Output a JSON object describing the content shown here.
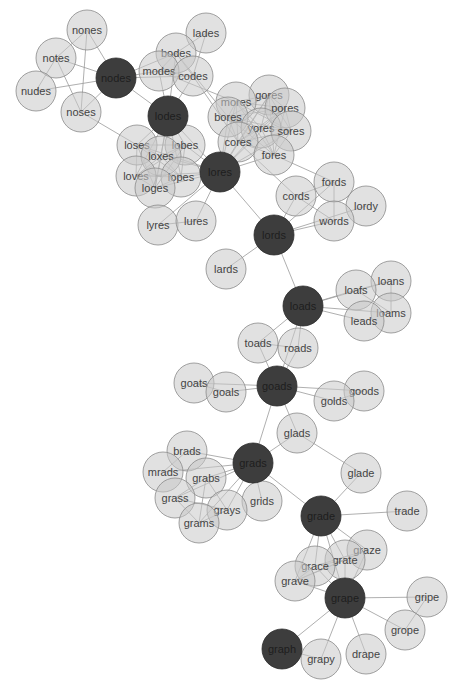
{
  "diagram": {
    "type": "word-ladder-network",
    "node_radius": 20,
    "colors": {
      "path_node": "#3d3d3d",
      "neighbor_node": "#d6d6d6",
      "edge": "#9a9a9a",
      "text": "#444444"
    },
    "nodes": [
      {
        "id": "nones",
        "x": 87,
        "y": 30,
        "dark": false
      },
      {
        "id": "lades",
        "x": 206,
        "y": 33,
        "dark": false
      },
      {
        "id": "notes",
        "x": 56,
        "y": 58,
        "dark": false
      },
      {
        "id": "bodes",
        "x": 176,
        "y": 53,
        "dark": false
      },
      {
        "id": "nodes",
        "x": 116,
        "y": 78,
        "dark": true
      },
      {
        "id": "modes",
        "x": 159,
        "y": 71,
        "dark": false
      },
      {
        "id": "codes",
        "x": 193,
        "y": 76,
        "dark": false
      },
      {
        "id": "nudes",
        "x": 36,
        "y": 91,
        "dark": false
      },
      {
        "id": "noses",
        "x": 81,
        "y": 112,
        "dark": false
      },
      {
        "id": "lodes",
        "x": 168,
        "y": 116,
        "dark": true
      },
      {
        "id": "gores",
        "x": 269,
        "y": 95,
        "dark": false
      },
      {
        "id": "mores",
        "x": 236,
        "y": 102,
        "dark": false
      },
      {
        "id": "pores",
        "x": 285,
        "y": 108,
        "dark": false
      },
      {
        "id": "bores",
        "x": 228,
        "y": 117,
        "dark": false
      },
      {
        "id": "yores",
        "x": 261,
        "y": 128,
        "dark": false
      },
      {
        "id": "sores",
        "x": 291,
        "y": 131,
        "dark": false
      },
      {
        "id": "cores",
        "x": 238,
        "y": 142,
        "dark": false
      },
      {
        "id": "fores",
        "x": 274,
        "y": 155,
        "dark": false
      },
      {
        "id": "loses",
        "x": 137,
        "y": 145,
        "dark": false
      },
      {
        "id": "lobes",
        "x": 185,
        "y": 145,
        "dark": false
      },
      {
        "id": "loxes",
        "x": 161,
        "y": 156,
        "dark": false
      },
      {
        "id": "loves",
        "x": 136,
        "y": 176,
        "dark": false
      },
      {
        "id": "lopes",
        "x": 181,
        "y": 177,
        "dark": false
      },
      {
        "id": "loges",
        "x": 155,
        "y": 188,
        "dark": false
      },
      {
        "id": "lores",
        "x": 220,
        "y": 172,
        "dark": true
      },
      {
        "id": "fords",
        "x": 334,
        "y": 182,
        "dark": false
      },
      {
        "id": "cords",
        "x": 296,
        "y": 196,
        "dark": false
      },
      {
        "id": "lordy",
        "x": 366,
        "y": 206,
        "dark": false
      },
      {
        "id": "words",
        "x": 334,
        "y": 221,
        "dark": false
      },
      {
        "id": "lyres",
        "x": 158,
        "y": 225,
        "dark": false
      },
      {
        "id": "lures",
        "x": 196,
        "y": 221,
        "dark": false
      },
      {
        "id": "lords",
        "x": 274,
        "y": 235,
        "dark": true
      },
      {
        "id": "lards",
        "x": 226,
        "y": 269,
        "dark": false
      },
      {
        "id": "loans",
        "x": 391,
        "y": 281,
        "dark": false
      },
      {
        "id": "loafs",
        "x": 356,
        "y": 290,
        "dark": false
      },
      {
        "id": "loads",
        "x": 303,
        "y": 306,
        "dark": true
      },
      {
        "id": "loams",
        "x": 391,
        "y": 313,
        "dark": false
      },
      {
        "id": "leads",
        "x": 364,
        "y": 321,
        "dark": false
      },
      {
        "id": "toads",
        "x": 258,
        "y": 343,
        "dark": false
      },
      {
        "id": "roads",
        "x": 298,
        "y": 348,
        "dark": false
      },
      {
        "id": "goats",
        "x": 194,
        "y": 383,
        "dark": false
      },
      {
        "id": "goals",
        "x": 226,
        "y": 392,
        "dark": false
      },
      {
        "id": "goads",
        "x": 277,
        "y": 386,
        "dark": true
      },
      {
        "id": "goods",
        "x": 364,
        "y": 391,
        "dark": false
      },
      {
        "id": "golds",
        "x": 334,
        "y": 401,
        "dark": false
      },
      {
        "id": "glads",
        "x": 297,
        "y": 433,
        "dark": false
      },
      {
        "id": "brads",
        "x": 187,
        "y": 451,
        "dark": false
      },
      {
        "id": "grads",
        "x": 253,
        "y": 463,
        "dark": true
      },
      {
        "id": "glade",
        "x": 361,
        "y": 473,
        "dark": false
      },
      {
        "id": "mrads",
        "x": 163,
        "y": 472,
        "dark": false
      },
      {
        "id": "grabs",
        "x": 206,
        "y": 478,
        "dark": false
      },
      {
        "id": "grass",
        "x": 175,
        "y": 498,
        "dark": false
      },
      {
        "id": "grids",
        "x": 262,
        "y": 501,
        "dark": false
      },
      {
        "id": "grays",
        "x": 227,
        "y": 510,
        "dark": false
      },
      {
        "id": "grams",
        "x": 199,
        "y": 523,
        "dark": false
      },
      {
        "id": "trade",
        "x": 407,
        "y": 511,
        "dark": false
      },
      {
        "id": "grade",
        "x": 321,
        "y": 516,
        "dark": true
      },
      {
        "id": "graze",
        "x": 367,
        "y": 550,
        "dark": false
      },
      {
        "id": "grate",
        "x": 345,
        "y": 560,
        "dark": false
      },
      {
        "id": "grace",
        "x": 315,
        "y": 566,
        "dark": false
      },
      {
        "id": "grave",
        "x": 295,
        "y": 581,
        "dark": false
      },
      {
        "id": "grape",
        "x": 345,
        "y": 598,
        "dark": true
      },
      {
        "id": "gripe",
        "x": 427,
        "y": 597,
        "dark": false
      },
      {
        "id": "grope",
        "x": 405,
        "y": 630,
        "dark": false
      },
      {
        "id": "graph",
        "x": 282,
        "y": 649,
        "dark": true
      },
      {
        "id": "grapy",
        "x": 321,
        "y": 659,
        "dark": false
      },
      {
        "id": "drape",
        "x": 366,
        "y": 654,
        "dark": false
      }
    ],
    "edges": [
      [
        "nodes",
        "nones"
      ],
      [
        "nodes",
        "notes"
      ],
      [
        "nodes",
        "nudes"
      ],
      [
        "nodes",
        "noses"
      ],
      [
        "nodes",
        "modes"
      ],
      [
        "nodes",
        "bodes"
      ],
      [
        "nodes",
        "codes"
      ],
      [
        "nodes",
        "lodes"
      ],
      [
        "nones",
        "notes"
      ],
      [
        "nones",
        "noses"
      ],
      [
        "notes",
        "noses"
      ],
      [
        "nudes",
        "notes"
      ],
      [
        "bodes",
        "modes"
      ],
      [
        "bodes",
        "codes"
      ],
      [
        "bodes",
        "lades"
      ],
      [
        "modes",
        "codes"
      ],
      [
        "bodes",
        "lodes"
      ],
      [
        "modes",
        "lodes"
      ],
      [
        "codes",
        "lodes"
      ],
      [
        "codes",
        "lades"
      ],
      [
        "lodes",
        "loses"
      ],
      [
        "lodes",
        "lobes"
      ],
      [
        "lodes",
        "loxes"
      ],
      [
        "lodes",
        "loves"
      ],
      [
        "lodes",
        "lopes"
      ],
      [
        "lodes",
        "loges"
      ],
      [
        "lodes",
        "lores"
      ],
      [
        "loses",
        "lobes"
      ],
      [
        "loses",
        "loxes"
      ],
      [
        "loses",
        "loves"
      ],
      [
        "loses",
        "lopes"
      ],
      [
        "loses",
        "loges"
      ],
      [
        "lobes",
        "loxes"
      ],
      [
        "lobes",
        "loves"
      ],
      [
        "lobes",
        "lopes"
      ],
      [
        "lobes",
        "loges"
      ],
      [
        "loxes",
        "loves"
      ],
      [
        "loxes",
        "lopes"
      ],
      [
        "loxes",
        "loges"
      ],
      [
        "loves",
        "lopes"
      ],
      [
        "loves",
        "loges"
      ],
      [
        "lopes",
        "loges"
      ],
      [
        "loses",
        "lores"
      ],
      [
        "lobes",
        "lores"
      ],
      [
        "loxes",
        "lores"
      ],
      [
        "loves",
        "lores"
      ],
      [
        "lopes",
        "lores"
      ],
      [
        "loges",
        "lores"
      ],
      [
        "noses",
        "loses"
      ],
      [
        "lores",
        "bores"
      ],
      [
        "lores",
        "cores"
      ],
      [
        "lores",
        "fores"
      ],
      [
        "lores",
        "gores"
      ],
      [
        "lores",
        "mores"
      ],
      [
        "lores",
        "pores"
      ],
      [
        "lores",
        "sores"
      ],
      [
        "lores",
        "yores"
      ],
      [
        "bores",
        "cores"
      ],
      [
        "bores",
        "fores"
      ],
      [
        "bores",
        "gores"
      ],
      [
        "bores",
        "mores"
      ],
      [
        "bores",
        "pores"
      ],
      [
        "bores",
        "sores"
      ],
      [
        "bores",
        "yores"
      ],
      [
        "cores",
        "fores"
      ],
      [
        "cores",
        "gores"
      ],
      [
        "cores",
        "mores"
      ],
      [
        "cores",
        "pores"
      ],
      [
        "cores",
        "sores"
      ],
      [
        "cores",
        "yores"
      ],
      [
        "fores",
        "gores"
      ],
      [
        "fores",
        "mores"
      ],
      [
        "fores",
        "pores"
      ],
      [
        "fores",
        "sores"
      ],
      [
        "fores",
        "yores"
      ],
      [
        "gores",
        "mores"
      ],
      [
        "gores",
        "pores"
      ],
      [
        "gores",
        "sores"
      ],
      [
        "gores",
        "yores"
      ],
      [
        "mores",
        "pores"
      ],
      [
        "mores",
        "sores"
      ],
      [
        "mores",
        "yores"
      ],
      [
        "pores",
        "sores"
      ],
      [
        "pores",
        "yores"
      ],
      [
        "sores",
        "yores"
      ],
      [
        "codes",
        "cores"
      ],
      [
        "modes",
        "mores"
      ],
      [
        "bodes",
        "bores"
      ],
      [
        "lores",
        "lyres"
      ],
      [
        "lores",
        "lures"
      ],
      [
        "lyres",
        "lures"
      ],
      [
        "lores",
        "lords"
      ],
      [
        "fores",
        "fords"
      ],
      [
        "cores",
        "cords"
      ],
      [
        "lords",
        "cords"
      ],
      [
        "lords",
        "fords"
      ],
      [
        "lords",
        "words"
      ],
      [
        "lords",
        "lordy"
      ],
      [
        "lords",
        "lards"
      ],
      [
        "lords",
        "loads"
      ],
      [
        "cords",
        "fords"
      ],
      [
        "cords",
        "words"
      ],
      [
        "fords",
        "words"
      ],
      [
        "loads",
        "loafs"
      ],
      [
        "loads",
        "loans"
      ],
      [
        "loads",
        "loams"
      ],
      [
        "loads",
        "leads"
      ],
      [
        "loafs",
        "loans"
      ],
      [
        "loafs",
        "loams"
      ],
      [
        "loans",
        "loams"
      ],
      [
        "loads",
        "toads"
      ],
      [
        "loads",
        "roads"
      ],
      [
        "loads",
        "goads"
      ],
      [
        "toads",
        "roads"
      ],
      [
        "toads",
        "goads"
      ],
      [
        "roads",
        "goads"
      ],
      [
        "goads",
        "goats"
      ],
      [
        "goads",
        "goals"
      ],
      [
        "goats",
        "goals"
      ],
      [
        "goads",
        "golds"
      ],
      [
        "goads",
        "goods"
      ],
      [
        "golds",
        "goods"
      ],
      [
        "goads",
        "glads"
      ],
      [
        "goads",
        "grads"
      ],
      [
        "grads",
        "glads"
      ],
      [
        "grads",
        "brads"
      ],
      [
        "grads",
        "mrads"
      ],
      [
        "grads",
        "grabs"
      ],
      [
        "grads",
        "grass"
      ],
      [
        "grads",
        "grams"
      ],
      [
        "grads",
        "grays"
      ],
      [
        "grads",
        "grids"
      ],
      [
        "grads",
        "grade"
      ],
      [
        "brads",
        "mrads"
      ],
      [
        "grabs",
        "grass"
      ],
      [
        "grabs",
        "grams"
      ],
      [
        "grabs",
        "grays"
      ],
      [
        "grass",
        "grams"
      ],
      [
        "grass",
        "grays"
      ],
      [
        "grams",
        "grays"
      ],
      [
        "glads",
        "glade"
      ],
      [
        "grade",
        "glade"
      ],
      [
        "grade",
        "trade"
      ],
      [
        "grade",
        "grace"
      ],
      [
        "grade",
        "grate"
      ],
      [
        "grade",
        "grave"
      ],
      [
        "grade",
        "graze"
      ],
      [
        "grade",
        "grape"
      ],
      [
        "grace",
        "grate"
      ],
      [
        "grace",
        "grave"
      ],
      [
        "grace",
        "graze"
      ],
      [
        "grate",
        "grave"
      ],
      [
        "grate",
        "graze"
      ],
      [
        "grave",
        "graze"
      ],
      [
        "grape",
        "grace"
      ],
      [
        "grape",
        "grate"
      ],
      [
        "grape",
        "grave"
      ],
      [
        "grape",
        "graze"
      ],
      [
        "grape",
        "gripe"
      ],
      [
        "grape",
        "grope"
      ],
      [
        "gripe",
        "grope"
      ],
      [
        "grape",
        "drape"
      ],
      [
        "grape",
        "grapy"
      ],
      [
        "grape",
        "graph"
      ],
      [
        "graph",
        "grapy"
      ]
    ]
  }
}
